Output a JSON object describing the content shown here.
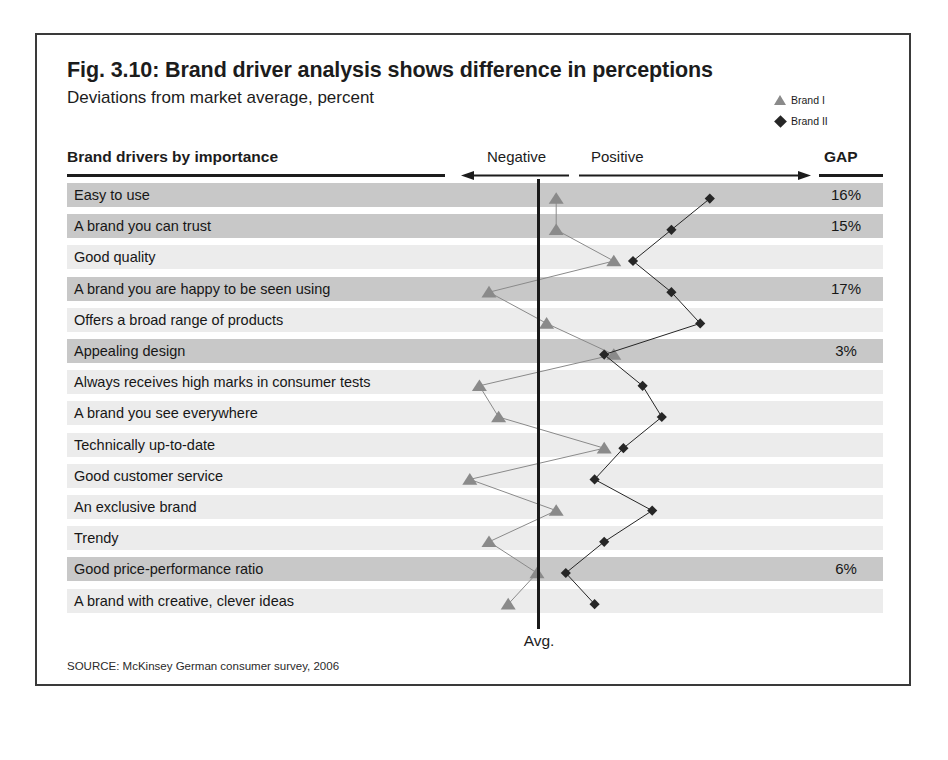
{
  "figure": {
    "title": "Fig. 3.10: Brand driver analysis shows difference in perceptions",
    "subtitle": "Deviations from market average, percent",
    "source": "SOURCE: McKinsey German consumer survey, 2006"
  },
  "legend": {
    "items": [
      {
        "label": "Brand I",
        "marker": "triangle-icon",
        "color": "#8a8a8a"
      },
      {
        "label": "Brand II",
        "marker": "diamond-icon",
        "color": "#262626"
      }
    ]
  },
  "header": {
    "drivers_label": "Brand drivers by importance",
    "negative_label": "Negative",
    "positive_label": "Positive",
    "gap_label": "GAP"
  },
  "axis": {
    "avg_label": "Avg."
  },
  "chart_data": {
    "type": "line",
    "title": "Fig. 3.10: Brand driver analysis shows difference in perceptions",
    "subtitle": "Deviations from market average, percent",
    "xlabel": "Deviations from market average, percent",
    "ylabel": "Brand drivers by importance",
    "orientation": "horizontal",
    "grid": false,
    "legend_position": "top-right",
    "axis_reference": {
      "label": "Avg.",
      "value": 0
    },
    "direction_labels": {
      "left": "Negative",
      "right": "Positive"
    },
    "categories": [
      "Easy to use",
      "A brand you can trust",
      "Good quality",
      "A brand you are happy to be seen using",
      "Offers a broad range of products",
      "Appealing design",
      "Always receives high marks in consumer tests",
      "A brand you see everywhere",
      "Technically up-to-date",
      "Good customer service",
      "An exclusive brand",
      "Trendy",
      "Good price-performance ratio",
      "A brand with creative, clever ideas"
    ],
    "series": [
      {
        "name": "Brand I",
        "marker": "triangle",
        "color": "#8a8a8a",
        "values": [
          2,
          2,
          8,
          -5,
          1,
          8,
          -6,
          -4,
          7,
          -7,
          2,
          -5,
          0,
          -3
        ]
      },
      {
        "name": "Brand II",
        "marker": "diamond",
        "color": "#262626",
        "values": [
          18,
          14,
          10,
          14,
          17,
          7,
          11,
          13,
          9,
          6,
          12,
          7,
          3,
          6
        ]
      }
    ],
    "gap_column": {
      "label": "GAP",
      "values": [
        "16%",
        "15%",
        "",
        "17%",
        "",
        "3%",
        "",
        "",
        "",
        "",
        "",
        "",
        "6%",
        ""
      ]
    },
    "row_highlight": [
      true,
      true,
      false,
      true,
      false,
      true,
      false,
      false,
      false,
      false,
      false,
      false,
      true,
      false
    ]
  }
}
